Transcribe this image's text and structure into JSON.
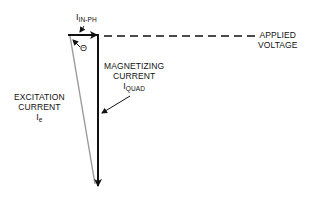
{
  "labels": {
    "in_phase": {
      "symbol": "I",
      "subscript": "IN-PH"
    },
    "theta": "Θ",
    "applied_voltage": {
      "line1": "APPLIED",
      "line2": "VOLTAGE"
    },
    "magnetizing": {
      "line1": "MAGNETIZING",
      "line2": "CURRENT",
      "symbol": "I",
      "subscript": "QUAD"
    },
    "excitation": {
      "line1": "EXCITATION",
      "line2": "CURRENT",
      "symbol": "I",
      "subscript": "e"
    }
  },
  "vectors": [
    {
      "name": "in-phase-current",
      "from": [
        68,
        35
      ],
      "to": [
        99,
        35
      ],
      "color": "#111111"
    },
    {
      "name": "magnetizing-current",
      "from": [
        98,
        35
      ],
      "to": [
        98,
        188
      ],
      "color": "#111111"
    },
    {
      "name": "excitation-current",
      "from": [
        70,
        36
      ],
      "to": [
        95,
        185
      ],
      "color": "#999999"
    },
    {
      "name": "applied-voltage-reference",
      "from": [
        103,
        36
      ],
      "to": [
        256,
        36
      ],
      "style": "dashed",
      "color": "#111111"
    }
  ],
  "colors": {
    "primary": "#111111",
    "secondary": "#999999",
    "background": "#ffffff"
  }
}
